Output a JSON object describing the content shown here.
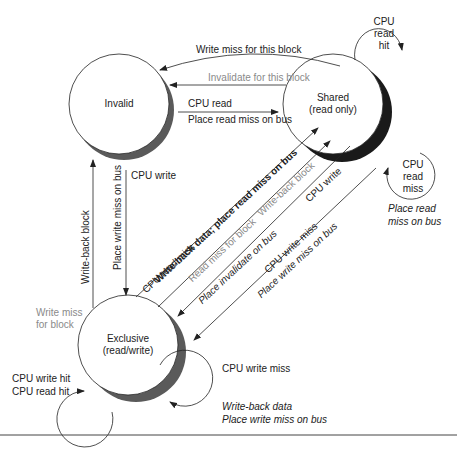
{
  "states": {
    "invalid": {
      "label": "Invalid"
    },
    "shared": {
      "label": "Shared",
      "sub": "(read only)"
    },
    "exclusive": {
      "label": "Exclusive",
      "sub": "(read/write)"
    }
  },
  "transitions": {
    "shared_to_invalid_write_miss": "Write miss for this block",
    "shared_to_invalid_invalidate": "Invalidate for this block",
    "invalid_to_shared_cpu_read": "CPU read",
    "invalid_to_shared_place": "Place read miss on bus",
    "invalid_to_exclusive_cpu_write": "CPU write",
    "invalid_to_exclusive_place": "Place write miss on bus",
    "exclusive_to_invalid_writeback": "Write-back block",
    "exclusive_to_invalid_write_miss_line1": "Write miss",
    "exclusive_to_invalid_write_miss_line2": "for block",
    "excl_to_shared_cpu_read_miss": "CPU read miss",
    "excl_to_shared_writeback": "Write-back data; place read miss on bus",
    "excl_to_shared_read_miss_for_block": "Read miss for block",
    "excl_to_shared_writeback_block": "Write-back block",
    "shared_to_excl_place_invalidate": "Place invalidate on bus",
    "shared_to_excl_cpu_write": "CPU write",
    "shared_to_excl_cpu_write_miss": "CPU write miss",
    "shared_to_excl_place_write_miss": "Place write miss on bus",
    "shared_loop_read_hit": [
      "CPU",
      "read",
      "hit"
    ],
    "shared_loop_read_miss": [
      "CPU",
      "read",
      "miss"
    ],
    "shared_loop_action_line1": "Place read",
    "shared_loop_action_line2": "miss on bus",
    "excl_loop_hit_line1": "CPU write hit",
    "excl_loop_hit_line2": "CPU read hit",
    "excl_loop_write_miss": "CPU write miss",
    "excl_loop_action_line1": "Write-back data",
    "excl_loop_action_line2": "Place write miss on bus"
  },
  "colors": {
    "line": "#222222",
    "gray_text": "#8a8a8a",
    "shadow": "#555555"
  }
}
